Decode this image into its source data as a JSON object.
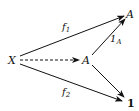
{
  "diagram": {
    "type": "commutative-diagram",
    "nodes": {
      "source": "X",
      "middle": "A",
      "top": "A",
      "bottom": "1"
    },
    "arrows": [
      {
        "from": "source",
        "to": "top",
        "label": "f",
        "label_sub": "1",
        "style": "solid"
      },
      {
        "from": "source",
        "to": "middle",
        "label": "",
        "style": "dashed"
      },
      {
        "from": "middle",
        "to": "top",
        "label": "1",
        "label_sub": "A",
        "style": "solid"
      },
      {
        "from": "middle",
        "to": "bottom",
        "label": "",
        "style": "solid"
      },
      {
        "from": "source",
        "to": "bottom",
        "label": "f",
        "label_sub": "2",
        "style": "solid"
      }
    ]
  }
}
